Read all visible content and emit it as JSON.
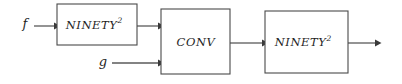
{
  "diagram": {
    "type": "block-flow-diagram",
    "background_color": "#ffffff",
    "line_color": "#5a5a5a",
    "box_stroke_color": "#4a4a4a",
    "text_color": "#1f1f1f",
    "inputs": [
      {
        "id": "f",
        "label": "f"
      },
      {
        "id": "g",
        "label": "g"
      }
    ],
    "blocks": [
      {
        "id": "ninety-squared-1",
        "label_base": "NINETY",
        "label_sup": "2"
      },
      {
        "id": "conv",
        "label_base": "CONV",
        "label_sup": ""
      },
      {
        "id": "ninety-squared-2",
        "label_base": "NINETY",
        "label_sup": "2"
      }
    ]
  }
}
